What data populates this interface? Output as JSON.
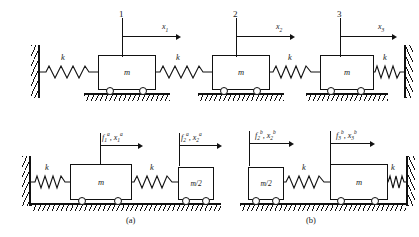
{
  "figure": {
    "top_system": {
      "spring_labels": [
        "k",
        "k",
        "k",
        "k"
      ],
      "masses": [
        {
          "label": "m",
          "index": "1",
          "coord": "x",
          "coord_sub": "1",
          "coord_sup": ""
        },
        {
          "label": "m",
          "index": "2",
          "coord": "x",
          "coord_sub": "2",
          "coord_sup": ""
        },
        {
          "label": "m",
          "index": "3",
          "coord": "x",
          "coord_sub": "3",
          "coord_sup": ""
        }
      ]
    },
    "subsystem_a": {
      "caption": "(a)",
      "spring_labels": [
        "k",
        "k"
      ],
      "masses": [
        {
          "label": "m"
        },
        {
          "label": "m/2"
        }
      ],
      "pointers": [
        {
          "force": "f",
          "force_sub": "1",
          "force_sup": "a",
          "coord": "x",
          "coord_sub": "1",
          "coord_sup": "a"
        },
        {
          "force": "f",
          "force_sub": "2",
          "force_sup": "a",
          "coord": "x",
          "coord_sub": "2",
          "coord_sup": "a"
        }
      ]
    },
    "subsystem_b": {
      "caption": "(b)",
      "spring_labels": [
        "k",
        "k"
      ],
      "masses": [
        {
          "label": "m/2"
        },
        {
          "label": "m"
        }
      ],
      "pointers": [
        {
          "force": "f",
          "force_sub": "2",
          "force_sup": "b",
          "coord": "x",
          "coord_sub": "2",
          "coord_sup": "b"
        },
        {
          "force": "f",
          "force_sub": "3",
          "force_sup": "b",
          "coord": "x",
          "coord_sub": "3",
          "coord_sup": "b"
        }
      ]
    },
    "colors": {
      "ink": "#111111",
      "background": "#ffffff"
    }
  }
}
